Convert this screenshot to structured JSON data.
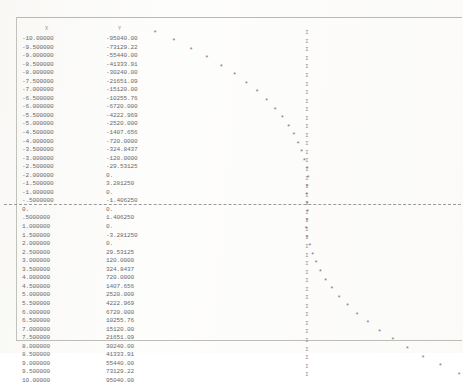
{
  "document": {
    "kind": "line-printer-output",
    "table": {
      "headers": {
        "x": "X",
        "y": "Y"
      },
      "rows": [
        {
          "x": "-10.00000",
          "y": "-95040.00"
        },
        {
          "x": "-9.500000",
          "y": "-73129.22"
        },
        {
          "x": "-9.000000",
          "y": "-55440.00"
        },
        {
          "x": "-8.500000",
          "y": "-41333.91"
        },
        {
          "x": "-8.000000",
          "y": "-30240.00"
        },
        {
          "x": "-7.500000",
          "y": "-21651.09"
        },
        {
          "x": "-7.000000",
          "y": "-15120.00"
        },
        {
          "x": "-6.500000",
          "y": "-10255.76"
        },
        {
          "x": "-6.000000",
          "y": "-6720.000"
        },
        {
          "x": "-5.500000",
          "y": "-4222.969"
        },
        {
          "x": "-5.000000",
          "y": "-2520.000"
        },
        {
          "x": "-4.500000",
          "y": "-1407.656"
        },
        {
          "x": "-4.000000",
          "y": "-720.0000"
        },
        {
          "x": "-3.500000",
          "y": "-324.8437"
        },
        {
          "x": "-3.000000",
          "y": "-120.0000"
        },
        {
          "x": "-2.500000",
          "y": "-29.53125"
        },
        {
          "x": "-2.000000",
          "y": "0."
        },
        {
          "x": "-1.500000",
          "y": "3.281250"
        },
        {
          "x": "-1.000000",
          "y": "0."
        },
        {
          "x": "-.5000000",
          "y": "-1.406250"
        },
        {
          "x": "0.",
          "y": "0."
        },
        {
          "x": ".5000000",
          "y": "1.406250"
        },
        {
          "x": "1.000000",
          "y": "0."
        },
        {
          "x": "1.500000",
          "y": "-3.281250"
        },
        {
          "x": "2.000000",
          "y": "0."
        },
        {
          "x": "2.500000",
          "y": "29.53125"
        },
        {
          "x": "3.000000",
          "y": "120.0000"
        },
        {
          "x": "3.500000",
          "y": "324.8437"
        },
        {
          "x": "4.000000",
          "y": "720.0000"
        },
        {
          "x": "4.500000",
          "y": "1407.656"
        },
        {
          "x": "5.000000",
          "y": "2520.000"
        },
        {
          "x": "5.500000",
          "y": "4222.969"
        },
        {
          "x": "6.000000",
          "y": "6720.000"
        },
        {
          "x": "6.500000",
          "y": "10255.76"
        },
        {
          "x": "7.000000",
          "y": "15120.00"
        },
        {
          "x": "7.500000",
          "y": "21651.09"
        },
        {
          "x": "8.000000",
          "y": "30240.00"
        },
        {
          "x": "8.500000",
          "y": "41333.91"
        },
        {
          "x": "9.000000",
          "y": "55440.00"
        },
        {
          "x": "9.500000",
          "y": "73129.22"
        },
        {
          "x": "10.00000",
          "y": "95040.00"
        }
      ]
    },
    "plot": {
      "point_glyph": "*",
      "axis_glyph": "I",
      "baseline_glyph": "-",
      "ink_color": "#6b6b70"
    }
  },
  "chart_data": {
    "type": "scatter",
    "title": "",
    "xlabel": "Y",
    "ylabel": "X",
    "orientation": "rotated-90",
    "grid": false,
    "legend": null,
    "note": "Character-cell printer plot: one row per table record; horizontal position encodes Y, vertical position encodes X. A vertical 'I' axis marks Y=0 and a horizontal dashed baseline marks X=0.",
    "xlim": [
      -95040,
      95040
    ],
    "ylim": [
      -10,
      10
    ],
    "x": [
      -10,
      -9.5,
      -9,
      -8.5,
      -8,
      -7.5,
      -7,
      -6.5,
      -6,
      -5.5,
      -5,
      -4.5,
      -4,
      -3.5,
      -3,
      -2.5,
      -2,
      -1.5,
      -1,
      -0.5,
      0,
      0.5,
      1,
      1.5,
      2,
      2.5,
      3,
      3.5,
      4,
      4.5,
      5,
      5.5,
      6,
      6.5,
      7,
      7.5,
      8,
      8.5,
      9,
      9.5,
      10
    ],
    "values": [
      -95040.0,
      -73129.22,
      -55440.0,
      -41333.91,
      -30240.0,
      -21651.09,
      -15120.0,
      -10255.76,
      -6720.0,
      -4222.969,
      -2520.0,
      -1407.656,
      -720.0,
      -324.8437,
      -120.0,
      -29.53125,
      0.0,
      3.28125,
      0.0,
      -1.40625,
      0.0,
      1.40625,
      0.0,
      -3.28125,
      0.0,
      29.53125,
      120.0,
      324.8437,
      720.0,
      1407.656,
      2520.0,
      4222.969,
      6720.0,
      10255.76,
      15120.0,
      21651.09,
      30240.0,
      41333.91,
      55440.0,
      73129.22,
      95040.0
    ]
  }
}
